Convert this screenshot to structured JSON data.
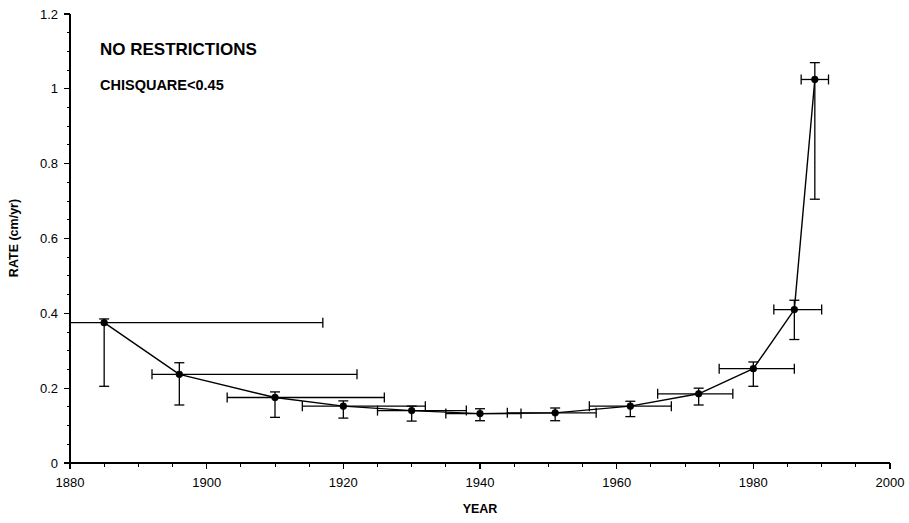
{
  "figure": {
    "width": 909,
    "height": 523
  },
  "annotations": {
    "main": "NO RESTRICTIONS",
    "sub": "CHISQUARE<0.45"
  },
  "chart_data": {
    "type": "line",
    "title": "",
    "subtitle": "",
    "xlabel": "YEAR",
    "ylabel": "RATE (cm/yr)",
    "xlim": [
      1880,
      2000
    ],
    "ylim": [
      0,
      1.2
    ],
    "xticks": [
      1880,
      1900,
      1920,
      1940,
      1960,
      1980,
      2000
    ],
    "xtick_labels": [
      "1880",
      "1900",
      "1920",
      "1940",
      "1960",
      "1980",
      "2000"
    ],
    "xminor_step": 5,
    "yticks": [
      0,
      0.2,
      0.4,
      0.6,
      0.8,
      1,
      1.2
    ],
    "ytick_labels": [
      "0",
      "0.2",
      "0.4",
      "0.6",
      "0.8",
      "1",
      "1.2"
    ],
    "yminor_step": 0.05,
    "grid": false,
    "legend": null,
    "marker": "filled-circle",
    "line_color": "#000000",
    "series": [
      {
        "name": "sea level rate",
        "x": [
          1885,
          1896,
          1910,
          1920,
          1930,
          1940,
          1951,
          1962,
          1972,
          1980,
          1986,
          1989
        ],
        "y": [
          0.375,
          0.237,
          0.175,
          0.152,
          0.14,
          0.132,
          0.134,
          0.152,
          0.185,
          0.252,
          0.41,
          1.025
        ],
        "yerr_low": [
          0.205,
          0.155,
          0.122,
          0.12,
          0.112,
          0.113,
          0.113,
          0.124,
          0.155,
          0.205,
          0.33,
          0.705
        ],
        "yerr_high": [
          0.385,
          0.268,
          0.19,
          0.166,
          0.152,
          0.145,
          0.147,
          0.165,
          0.2,
          0.27,
          0.435,
          1.07
        ],
        "xrange_low": [
          1880,
          1892,
          1903,
          1914,
          1925,
          1935,
          1944,
          1956,
          1966,
          1975,
          1983,
          1987
        ],
        "xrange_high": [
          1917,
          1922,
          1926,
          1932,
          1938,
          1946,
          1957,
          1968,
          1977,
          1986,
          1990,
          1991
        ]
      }
    ]
  }
}
